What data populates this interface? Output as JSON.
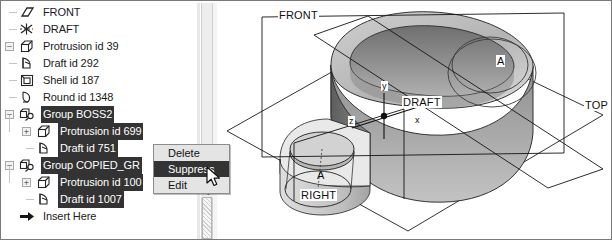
{
  "app": {
    "title": "Pro/ENGINEER Model Tree with Context Menu"
  },
  "tree": {
    "name": "model-tree",
    "items": [
      {
        "label": "FRONT",
        "icon": "datum-plane-icon",
        "indent": 0,
        "selected": false,
        "expander": "none"
      },
      {
        "label": "DRAFT",
        "icon": "datum-axis-icon",
        "indent": 0,
        "selected": false,
        "expander": "none"
      },
      {
        "label": "Protrusion id 39",
        "icon": "protrusion-icon",
        "indent": 0,
        "selected": false,
        "expander": "minus"
      },
      {
        "label": "Draft id 292",
        "icon": "draft-icon",
        "indent": 0,
        "selected": false,
        "expander": "none"
      },
      {
        "label": "Shell id 187",
        "icon": "shell-icon",
        "indent": 0,
        "selected": false,
        "expander": "none"
      },
      {
        "label": "Round id 1348",
        "icon": "round-icon",
        "indent": 0,
        "selected": false,
        "expander": "none"
      },
      {
        "label": "Group BOSS2",
        "icon": "group-icon",
        "indent": 0,
        "selected": true,
        "expander": "minus"
      },
      {
        "label": "Protrusion id 699",
        "icon": "protrusion-icon",
        "indent": 1,
        "selected": true,
        "expander": "plus"
      },
      {
        "label": "Draft id 751",
        "icon": "draft-icon",
        "indent": 1,
        "selected": true,
        "expander": "none"
      },
      {
        "label": "Group COPIED_GR",
        "icon": "group-icon",
        "indent": 0,
        "selected": true,
        "expander": "minus"
      },
      {
        "label": "Protrusion id 100",
        "icon": "protrusion-icon",
        "indent": 1,
        "selected": true,
        "expander": "plus"
      },
      {
        "label": "Draft id 1007",
        "icon": "draft-icon",
        "indent": 1,
        "selected": true,
        "expander": "none"
      },
      {
        "label": "Insert Here",
        "icon": "insert-here-icon",
        "indent": 0,
        "selected": false,
        "expander": "none"
      }
    ]
  },
  "context_menu": {
    "name": "feature-context-menu",
    "items": [
      {
        "label": "Delete",
        "highlighted": false
      },
      {
        "label": "Suppress",
        "highlighted": true
      },
      {
        "label": "Edit",
        "highlighted": false
      }
    ]
  },
  "viewport": {
    "name": "graphics-window",
    "datum_labels": [
      {
        "text": "FRONT",
        "x": 60,
        "y": 12
      },
      {
        "text": "DRAFT",
        "x": 184,
        "y": 99
      },
      {
        "text": "TOP",
        "x": 366,
        "y": 102
      },
      {
        "text": "RIGHT",
        "x": 88,
        "y": 193
      }
    ],
    "axis_labels": [
      {
        "text": "y",
        "x": 165,
        "y": 88
      },
      {
        "text": "x",
        "x": 195,
        "y": 126
      },
      {
        "text": "z",
        "x": 138,
        "y": 122
      }
    ],
    "section_labels": [
      {
        "text": "A",
        "x": 280,
        "y": 60
      },
      {
        "text": "A",
        "x": 138,
        "y": 173
      }
    ]
  },
  "colors": {
    "selection_bg": "#333333",
    "selection_fg": "#ffffff",
    "menu_bg": "#e4e4e4",
    "model_light": "#c9c9c9",
    "model_mid": "#9a9a9a",
    "model_dark": "#6d6d6d",
    "outline": "#1a1a1a"
  },
  "scrollbar": {
    "name": "tree-horizontal-scrollbar",
    "arrow_glyph": "◂"
  }
}
